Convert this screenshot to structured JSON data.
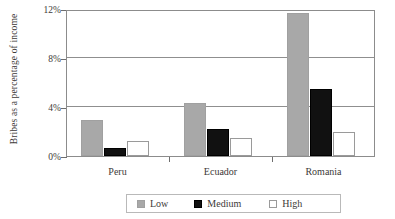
{
  "chart_data": {
    "type": "bar",
    "title": "",
    "xlabel": "",
    "ylabel": "Bribes as a percentage of income",
    "categories": [
      "Peru",
      "Ecuador",
      "Romania"
    ],
    "series": [
      {
        "name": "Low",
        "color": "#a8a8a8",
        "values": [
          2.9,
          4.3,
          11.7
        ]
      },
      {
        "name": "Medium",
        "color": "#111111",
        "values": [
          0.65,
          2.2,
          5.45
        ]
      },
      {
        "name": "High",
        "color": "#ffffff",
        "values": [
          1.2,
          1.5,
          2.0
        ]
      }
    ],
    "ylim": [
      0,
      12
    ],
    "yticks": [
      "0%",
      "4%",
      "8%",
      "12%"
    ],
    "ytick_values": [
      0,
      4,
      8,
      12
    ],
    "grid": true,
    "legend_position": "bottom"
  }
}
